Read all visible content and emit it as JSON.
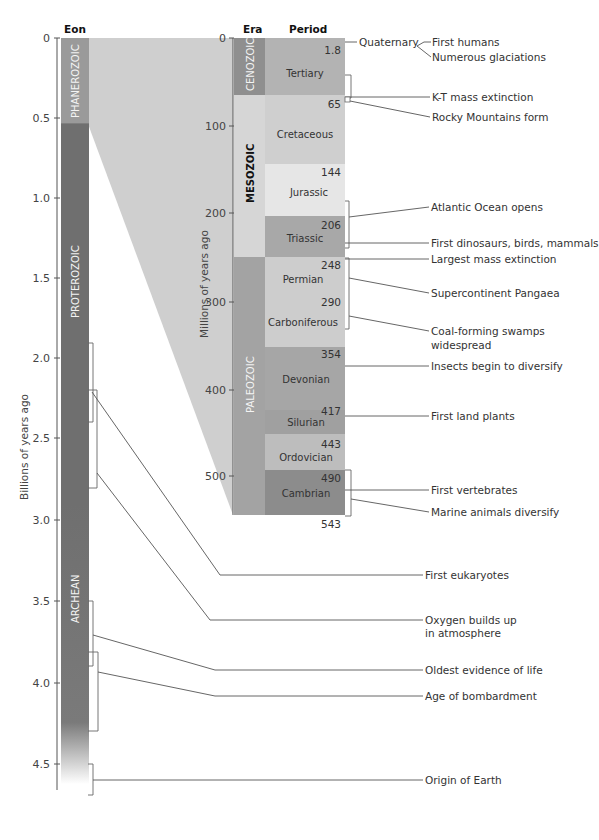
{
  "left_column": {
    "header": "Eon",
    "axis_label": "Billions of years ago",
    "ticks": [
      "0",
      "0.5",
      "1.0",
      "1.5",
      "2.0",
      "2.5",
      "3.0",
      "3.5",
      "4.0",
      "4.5"
    ],
    "eons": [
      {
        "name": "PHANEROZOIC",
        "start": 0,
        "end": 0.543,
        "color": "#9a9a9a"
      },
      {
        "name": "PROTEROZOIC",
        "start": 0.543,
        "end": 2.5,
        "color": "#6f6f6f"
      },
      {
        "name": "ARCHEAN",
        "start": 2.5,
        "end": 4.6,
        "color": "#6f6f6f"
      }
    ]
  },
  "right_column": {
    "era_header": "Era",
    "period_header": "Period",
    "axis_label": "Millions of years ago",
    "ticks": [
      "0",
      "100",
      "200",
      "300",
      "400",
      "500"
    ],
    "eras": [
      {
        "name": "CENOZOIC",
        "color": "#8f8f8f"
      },
      {
        "name": "MESOZOIC",
        "color": "#d6d6d6"
      },
      {
        "name": "PALEOZOIC",
        "color": "#a3a3a3"
      }
    ],
    "periods": [
      {
        "name": "Tertiary",
        "top_label": "1.8",
        "color": "#b3b3b3"
      },
      {
        "name": "Cretaceous",
        "top_label": "65",
        "color": "#cfcfcf"
      },
      {
        "name": "Jurassic",
        "top_label": "144",
        "color": "#e6e6e6"
      },
      {
        "name": "Triassic",
        "top_label": "206",
        "color": "#a8a8a8"
      },
      {
        "name": "Permian",
        "top_label": "248",
        "color": "#cdcdcd"
      },
      {
        "name": "Carboniferous",
        "top_label": "290",
        "color": "#cdcdcd"
      },
      {
        "name": "Devonian",
        "top_label": "354",
        "color": "#a6a6a6"
      },
      {
        "name": "Silurian",
        "top_label": "417",
        "color": "#a6a6a6"
      },
      {
        "name": "Ordovician",
        "top_label": "443",
        "color": "#bdbdbd"
      },
      {
        "name": "Cambrian",
        "top_label": "490",
        "color": "#8c8c8c"
      }
    ],
    "bottom_label": "543",
    "quaternary_label": "Quaternary"
  },
  "events": {
    "first_humans": "First humans",
    "glaciations": "Numerous glaciations",
    "kt": "K-T mass extinction",
    "rocky": "Rocky Mountains form",
    "atlantic": "Atlantic Ocean opens",
    "dinos": "First dinosaurs, birds, mammals",
    "largest": "Largest mass extinction",
    "pangaea": "Supercontinent Pangaea",
    "coal_1": "Coal-forming swamps",
    "coal_2": "widespread",
    "insects": "Insects begin to diversify",
    "land_plants": "First land plants",
    "vertebrates": "First vertebrates",
    "marine": "Marine animals diversify",
    "eukaryotes": "First eukaryotes",
    "oxygen_1": "Oxygen builds up",
    "oxygen_2": "in atmosphere",
    "oldest_life": "Oldest evidence of life",
    "bombardment": "Age of bombardment",
    "origin": "Origin of Earth"
  }
}
